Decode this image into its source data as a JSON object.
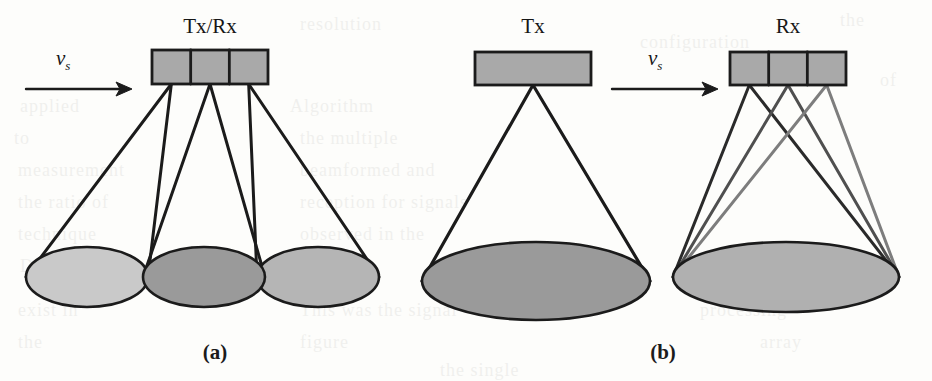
{
  "figure": {
    "width": 932,
    "height": 381,
    "background": "#fdfdfb",
    "ink_color": "#1b1b1b"
  },
  "panels": [
    {
      "id": "panel-a",
      "caption": "(a)",
      "caption_x": 215,
      "caption_y": 340,
      "array": {
        "label": "Tx/Rx",
        "label_x": 210,
        "label_y": 14,
        "x": 152,
        "y": 50,
        "width": 116,
        "height": 34,
        "segments": 3,
        "fill": "#a9a9a9",
        "stroke": "#1b1b1b"
      },
      "speed_arrow": {
        "label": "v",
        "subscript": "s",
        "label_x": 56,
        "label_y": 46,
        "x1": 26,
        "y1": 89,
        "x2": 132,
        "y2": 89
      },
      "footprints": [
        {
          "name": "footprint-left",
          "cx": 87,
          "cy": 277,
          "rx": 61,
          "ry": 30,
          "fill": "#c9c9c9"
        },
        {
          "name": "footprint-center",
          "cx": 204,
          "cy": 277,
          "rx": 61,
          "ry": 30,
          "fill": "#9a9a9a"
        },
        {
          "name": "footprint-right",
          "cx": 318,
          "cy": 277,
          "rx": 61,
          "ry": 30,
          "fill": "#b5b5b5"
        }
      ]
    },
    {
      "id": "panel-b",
      "caption": "(b)",
      "caption_x": 663,
      "caption_y": 340,
      "tx_array": {
        "label": "Tx",
        "label_x": 532,
        "label_y": 14,
        "x": 475,
        "y": 52,
        "width": 116,
        "height": 33,
        "segments": 1,
        "fill": "#a9a9a9",
        "stroke": "#1b1b1b"
      },
      "rx_array": {
        "label": "Rx",
        "label_x": 787,
        "label_y": 14,
        "x": 730,
        "y": 52,
        "width": 116,
        "height": 33,
        "segments": 3,
        "fill": "#a9a9a9",
        "stroke": "#1b1b1b"
      },
      "speed_arrow": {
        "label": "v",
        "subscript": "s",
        "label_x": 648,
        "label_y": 46,
        "x1": 612,
        "y1": 89,
        "x2": 718,
        "y2": 89
      },
      "footprints": [
        {
          "name": "footprint-tx",
          "cx": 536,
          "cy": 281,
          "rx": 114,
          "ry": 39,
          "fill": "#9a9a9a"
        },
        {
          "name": "footprint-rx",
          "cx": 786,
          "cy": 277,
          "rx": 113,
          "ry": 35,
          "fill": "#b0b0b0"
        }
      ]
    }
  ],
  "bleed_text": [
    {
      "text": "resolution",
      "x": 300,
      "y": 14,
      "size": 18
    },
    {
      "text": "the",
      "x": 840,
      "y": 10,
      "size": 18
    },
    {
      "text": "applied",
      "x": 20,
      "y": 96,
      "size": 18
    },
    {
      "text": "Algorithm",
      "x": 290,
      "y": 96,
      "size": 18
    },
    {
      "text": "of",
      "x": 880,
      "y": 70,
      "size": 18
    },
    {
      "text": "to",
      "x": 14,
      "y": 128,
      "size": 18
    },
    {
      "text": "the multiple",
      "x": 300,
      "y": 128,
      "size": 18
    },
    {
      "text": "measurement",
      "x": 18,
      "y": 160,
      "size": 18
    },
    {
      "text": "beamformed and",
      "x": 300,
      "y": 160,
      "size": 18
    },
    {
      "text": "the ratio of",
      "x": 18,
      "y": 192,
      "size": 18
    },
    {
      "text": "reception for signals",
      "x": 300,
      "y": 192,
      "size": 18
    },
    {
      "text": "technique",
      "x": 18,
      "y": 224,
      "size": 18
    },
    {
      "text": "observed in the",
      "x": 300,
      "y": 224,
      "size": 18
    },
    {
      "text": "Doppler",
      "x": 20,
      "y": 256,
      "size": 18
    },
    {
      "text": "configuration",
      "x": 640,
      "y": 32,
      "size": 18
    },
    {
      "text": "exist in",
      "x": 18,
      "y": 300,
      "size": 18
    },
    {
      "text": "This was the signal",
      "x": 300,
      "y": 300,
      "size": 18
    },
    {
      "text": "processing",
      "x": 700,
      "y": 300,
      "size": 18
    },
    {
      "text": "the",
      "x": 18,
      "y": 332,
      "size": 18
    },
    {
      "text": "figure",
      "x": 300,
      "y": 332,
      "size": 18
    },
    {
      "text": "array",
      "x": 760,
      "y": 332,
      "size": 18
    },
    {
      "text": "the single",
      "x": 440,
      "y": 360,
      "size": 18
    }
  ]
}
